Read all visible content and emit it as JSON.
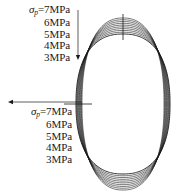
{
  "figure": {
    "background_color": "#ffffff",
    "curve_color": "#1a1a1a",
    "annotation_color": "#1a1a1a"
  },
  "labels": {
    "top_group": {
      "name": "top-pressure-label-group",
      "symbol": "σ",
      "subscript": "p",
      "equals": "=",
      "rows": [
        {
          "value": "7",
          "unit": "MPa",
          "text": "7MPa",
          "show_symbol": true
        },
        {
          "value": "6",
          "unit": "MPa",
          "text": "6MPa",
          "show_symbol": false
        },
        {
          "value": "5",
          "unit": "MPa",
          "text": "5MPa",
          "show_symbol": false
        },
        {
          "value": "4",
          "unit": "MPa",
          "text": "4MPa",
          "show_symbol": false
        },
        {
          "value": "3",
          "unit": "MPa",
          "text": "3MPa",
          "show_symbol": false
        }
      ]
    },
    "bottom_group": {
      "name": "bottom-pressure-label-group",
      "symbol": "σ",
      "subscript": "p",
      "equals": "=",
      "rows": [
        {
          "value": "7",
          "unit": "MPa",
          "text": "7MPa",
          "show_symbol": true
        },
        {
          "value": "6",
          "unit": "MPa",
          "text": "6MPa",
          "show_symbol": false
        },
        {
          "value": "5",
          "unit": "MPa",
          "text": "5MPa",
          "show_symbol": false
        },
        {
          "value": "4",
          "unit": "MPa",
          "text": "4MPa",
          "show_symbol": false
        },
        {
          "value": "3",
          "unit": "MPa",
          "text": "3MPa",
          "show_symbol": false
        }
      ]
    }
  },
  "annotations": {
    "vertical_arrow": {
      "name": "downward-arrow",
      "direction": "down",
      "x": 78,
      "y_start": 10,
      "y_end": 60
    },
    "horizontal_arrow": {
      "name": "leftward-arrow",
      "direction": "left",
      "x_start": 82,
      "x_end": 8,
      "y": 102
    },
    "top_tick": {
      "name": "apex-vertical-tick",
      "x": 123,
      "y_start": 14,
      "y_end": 40
    },
    "left_tick": {
      "name": "side-horizontal-tick",
      "x_start": 64,
      "x_end": 92,
      "y": 104
    }
  },
  "chart_data": {
    "type": "line",
    "xlabel": "",
    "ylabel": "",
    "legend_position": "left",
    "grid": false,
    "series_count": 10,
    "series": [
      {
        "name": "σp=7MPa",
        "pressure": 7,
        "unit": "MPa",
        "ry_top": 36,
        "rx": 48
      },
      {
        "name": "σp=6MPa",
        "pressure": 6,
        "unit": "MPa",
        "ry_top": 33,
        "rx": 47
      },
      {
        "name": "σp=5MPa",
        "pressure": 5,
        "unit": "MPa",
        "ry_top": 30,
        "rx": 46
      },
      {
        "name": "σp=4MPa",
        "pressure": 4,
        "unit": "MPa",
        "ry_top": 27,
        "rx": 45
      },
      {
        "name": "σp=3MPa",
        "pressure": 3,
        "unit": "MPa",
        "ry_top": 24,
        "rx": 44
      }
    ],
    "center": {
      "x": 123,
      "y": 104
    }
  }
}
